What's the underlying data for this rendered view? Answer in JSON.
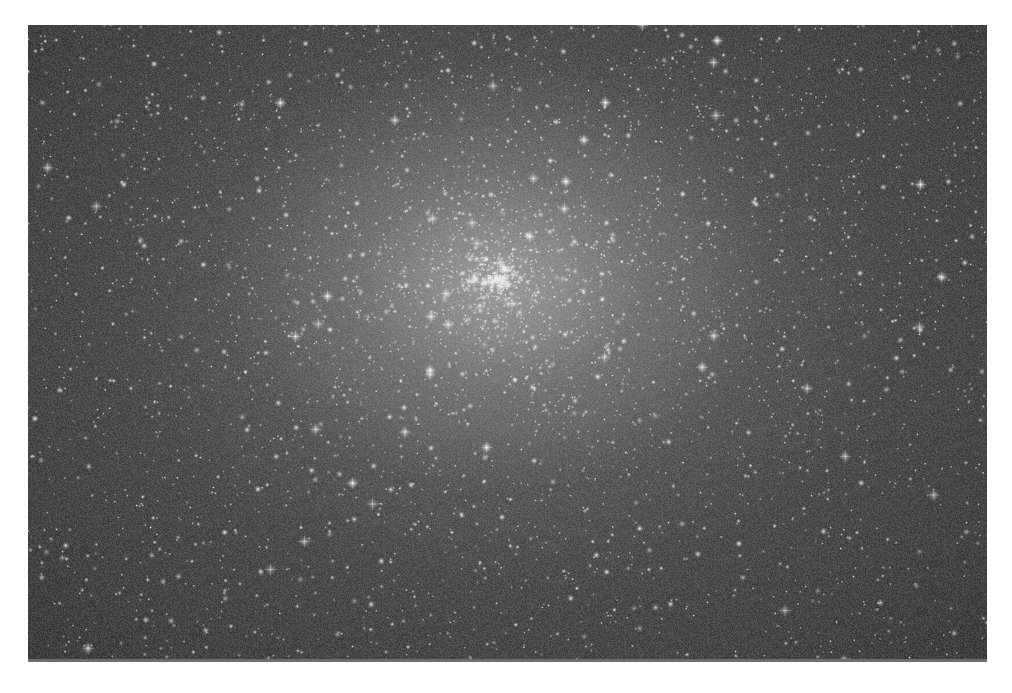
{
  "image": {
    "subject": "Globular star cluster (grayscale astronomical photograph)",
    "alt": "Dense field of stars with a bright, concentrated core slightly above and left of center",
    "frame": {
      "left": 28,
      "top": 25,
      "width": 959,
      "height": 637
    },
    "colors": {
      "page_background": "#ffffff",
      "sky_edge": "#2c2c2c",
      "sky_mid": "#3e3e3e",
      "core_glow": "#c8c8c8",
      "star": "#ffffff",
      "bottom_edge_line": "#6e6e6e"
    },
    "core_center_pct": {
      "x": 49,
      "y": 40
    },
    "star_count": 4200
  }
}
